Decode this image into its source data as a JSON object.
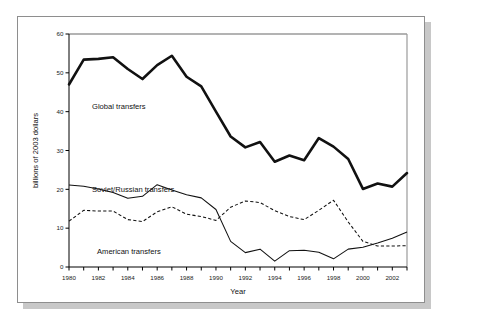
{
  "chart_data": {
    "type": "line",
    "title": "",
    "xlabel": "Year",
    "ylabel": "billions of 2003 dollars",
    "xlim": [
      1980,
      2003
    ],
    "ylim": [
      0,
      60
    ],
    "yticks": [
      0,
      10,
      20,
      30,
      40,
      50,
      60
    ],
    "xticks": [
      1980,
      1982,
      1984,
      1986,
      1988,
      1990,
      1992,
      1994,
      1996,
      1998,
      2000,
      2002
    ],
    "xtick_minor_every": 1,
    "grid": false,
    "legend_position": "inline-annotations",
    "x": [
      1980,
      1981,
      1982,
      1983,
      1984,
      1985,
      1986,
      1987,
      1988,
      1989,
      1990,
      1991,
      1992,
      1993,
      1994,
      1995,
      1996,
      1997,
      1998,
      1999,
      2000,
      2001,
      2002,
      2003
    ],
    "series": [
      {
        "name": "Global transfers",
        "style": "thick-solid",
        "color": "#111111",
        "values": [
          47.0,
          53.4,
          53.6,
          54.0,
          51.0,
          48.4,
          52.0,
          54.4,
          49.0,
          46.5,
          40.0,
          33.6,
          30.8,
          32.2,
          27.1,
          28.7,
          27.5,
          33.2,
          31.0,
          27.8,
          20.1,
          21.5,
          20.7,
          24.2
        ]
      },
      {
        "name": "Soviet/Russian transfers",
        "style": "dashed",
        "color": "#111111",
        "values": [
          11.8,
          14.6,
          14.4,
          14.4,
          12.2,
          11.7,
          14.2,
          15.5,
          13.6,
          13.0,
          12.0,
          15.4,
          17.0,
          16.6,
          14.5,
          13.0,
          12.2,
          14.6,
          17.2,
          11.6,
          6.6,
          5.4,
          5.4,
          5.5
        ]
      },
      {
        "name": "American transfers",
        "style": "thin-solid",
        "color": "#111111",
        "values": [
          21.1,
          20.8,
          20.1,
          19.2,
          17.7,
          18.2,
          21.2,
          19.8,
          18.6,
          17.8,
          14.8,
          6.6,
          3.7,
          4.6,
          1.5,
          4.2,
          4.3,
          3.8,
          2.1,
          4.6,
          5.1,
          6.2,
          7.4,
          9.0
        ]
      }
    ],
    "annotations": [
      {
        "text": "Global transfers",
        "x_px": 74,
        "y_px": 92
      },
      {
        "text": "Soviet/Russian transfers",
        "x_px": 74,
        "y_px": 175
      },
      {
        "text": "American transfers",
        "x_px": 79,
        "y_px": 237
      }
    ]
  }
}
